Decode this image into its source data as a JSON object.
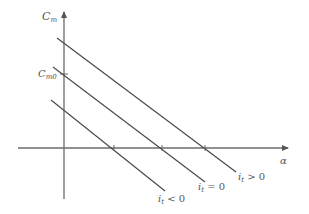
{
  "diagram": {
    "y_axis": {
      "label": "C",
      "label_sub": "m",
      "x": 64,
      "y_top": 12,
      "y_bottom": 199
    },
    "x_axis": {
      "label": "α",
      "y": 148,
      "x_left": 18,
      "x_right": 288
    },
    "y_intercept_label": {
      "text": "C",
      "sub": "m0",
      "y": 74
    },
    "lines": [
      {
        "id": "it-positive",
        "label_i": "i",
        "label_sub": "t",
        "label_rel": " > 0",
        "x1": 57,
        "y1": 38,
        "x2": 236,
        "y2": 172,
        "label_x": 238,
        "label_y": 180
      },
      {
        "id": "it-zero",
        "label_i": "i",
        "label_sub": "t",
        "label_rel": " = 0",
        "x1": 53,
        "y1": 67,
        "x2": 205,
        "y2": 182,
        "label_x": 198,
        "label_y": 190
      },
      {
        "id": "it-negative",
        "label_i": "i",
        "label_sub": "t",
        "label_rel": " < 0",
        "x1": 51,
        "y1": 100,
        "x2": 165,
        "y2": 191,
        "label_x": 158,
        "label_y": 202
      }
    ],
    "x_ticks": [
      114,
      162,
      205
    ],
    "colors": {
      "axis": "#6b6b6b",
      "line": "#4a4a4a",
      "text": "#555555",
      "background": "#ffffff"
    }
  }
}
